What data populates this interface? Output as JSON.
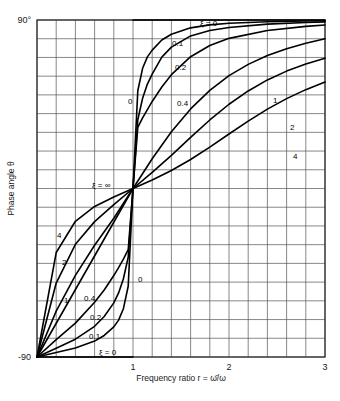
{
  "chart_data": {
    "type": "line",
    "title": "",
    "subtitle": "",
    "xlabel": "Frequency ratio r = ω̄/ω",
    "ylabel": "Phase angle θ",
    "xlim": [
      0,
      3
    ],
    "ylim": [
      -90,
      90
    ],
    "grid": true,
    "x_ticks": [
      "1",
      "2",
      "3"
    ],
    "x_tick_values": [
      1,
      2,
      3
    ],
    "y_ticks": [
      "90°",
      "-90"
    ],
    "y_tick_values": [
      90,
      -90
    ],
    "y_tick_top": "90°",
    "y_tick_bottom": "-90",
    "legend_position": "inline-annotations",
    "grid_x_step": 0.2,
    "grid_y_step": 10,
    "series": [
      {
        "name": "ξ = 0",
        "zeta": 0,
        "x": [
          0,
          0.2,
          0.4,
          0.6,
          0.8,
          0.9,
          0.98,
          1.0,
          1.02,
          1.1,
          1.2,
          1.4,
          1.6,
          1.8,
          2.0,
          2.2,
          2.4,
          2.6,
          2.8,
          3.0
        ],
        "y": [
          -90,
          -90,
          -90,
          -90,
          -90,
          -90,
          -90,
          0,
          90,
          90,
          90,
          90,
          90,
          90,
          90,
          90,
          90,
          90,
          90,
          90
        ]
      },
      {
        "name": "0.1",
        "zeta": 0.1,
        "x": [
          0,
          0.2,
          0.4,
          0.6,
          0.7,
          0.8,
          0.85,
          0.9,
          0.95,
          1.0,
          1.05,
          1.1,
          1.15,
          1.2,
          1.3,
          1.4,
          1.6,
          1.8,
          2.0,
          2.4,
          2.8,
          3.0
        ],
        "y": [
          -90,
          -87.6,
          -85.2,
          -81.5,
          -78.5,
          -73.9,
          -70.3,
          -64.2,
          -52.2,
          0,
          52.2,
          64.2,
          70.3,
          73.9,
          79.3,
          82.4,
          85.8,
          87.4,
          88.3,
          89.1,
          89.5,
          89.6
        ]
      },
      {
        "name": "0.2",
        "zeta": 0.2,
        "x": [
          0,
          0.2,
          0.4,
          0.6,
          0.7,
          0.8,
          0.85,
          0.9,
          0.95,
          1.0,
          1.05,
          1.1,
          1.15,
          1.2,
          1.3,
          1.4,
          1.6,
          1.8,
          2.0,
          2.4,
          2.8,
          3.0
        ],
        "y": [
          -90,
          -85.3,
          -80.5,
          -73.6,
          -68.4,
          -61.1,
          -55.8,
          -48.2,
          -36.7,
          0,
          36.7,
          48.2,
          55.8,
          61.1,
          70.2,
          75.5,
          81.5,
          84.4,
          86.0,
          87.8,
          88.7,
          89.0
        ]
      },
      {
        "name": "0.4",
        "zeta": 0.4,
        "x": [
          0,
          0.2,
          0.4,
          0.6,
          0.7,
          0.8,
          0.85,
          0.9,
          0.95,
          1.0,
          1.05,
          1.1,
          1.2,
          1.3,
          1.4,
          1.6,
          1.8,
          2.0,
          2.4,
          2.8,
          3.0
        ],
        "y": [
          -90,
          -80.7,
          -71.9,
          -60.8,
          -54.2,
          -46.5,
          -42.3,
          -37.7,
          -32.7,
          0,
          32.7,
          37.7,
          46.5,
          54.2,
          60.8,
          70.4,
          76.4,
          80.2,
          84.4,
          86.6,
          87.3
        ]
      },
      {
        "name": "1",
        "zeta": 1.0,
        "x": [
          0,
          0.2,
          0.4,
          0.6,
          0.8,
          1.0,
          1.2,
          1.4,
          1.6,
          1.8,
          2.0,
          2.2,
          2.4,
          2.6,
          2.8,
          3.0
        ],
        "y": [
          -90,
          -65.5,
          -46.4,
          -30.3,
          -15.9,
          0,
          15.9,
          30.3,
          42.5,
          52.4,
          60.3,
          66.3,
          71.0,
          74.7,
          77.6,
          80.0
        ]
      },
      {
        "name": "2",
        "zeta": 2.0,
        "x": [
          0,
          0.2,
          0.4,
          0.6,
          0.8,
          1.0,
          1.2,
          1.4,
          1.6,
          1.8,
          2.0,
          2.2,
          2.4,
          2.6,
          2.8,
          3.0
        ],
        "y": [
          -90,
          -50.5,
          -29.8,
          -17.7,
          -8.6,
          0,
          8.6,
          17.7,
          27.3,
          36.6,
          45.0,
          52.1,
          58.0,
          62.7,
          66.5,
          69.6
        ]
      },
      {
        "name": "4",
        "zeta": 4.0,
        "x": [
          0,
          0.2,
          0.4,
          0.6,
          0.8,
          1.0,
          1.2,
          1.4,
          1.6,
          1.8,
          2.0,
          2.2,
          2.4,
          2.6,
          2.8,
          3.0
        ],
        "y": [
          -90,
          -34.2,
          -17.5,
          -9.6,
          -4.5,
          0,
          4.5,
          9.6,
          15.5,
          22.1,
          29.1,
          36.0,
          42.4,
          48.0,
          52.8,
          56.9
        ]
      },
      {
        "name": "ξ = ∞",
        "zeta": "infinity",
        "x": [
          0,
          1.0
        ],
        "y": [
          -90,
          0
        ]
      }
    ],
    "annotations": [
      {
        "text": "ξ = 0",
        "x_px": 200,
        "y_px": 26,
        "name": "curve-label-zeta-0-top"
      },
      {
        "text": "0.1",
        "x_px": 172,
        "y_px": 46,
        "name": "curve-label-0p1-top"
      },
      {
        "text": "0.2",
        "x_px": 175,
        "y_px": 70,
        "name": "curve-label-0p2-top"
      },
      {
        "text": "0.4",
        "x_px": 177,
        "y_px": 106,
        "name": "curve-label-0p4-top"
      },
      {
        "text": "0",
        "x_px": 128,
        "y_px": 104,
        "name": "curve-label-0-upper"
      },
      {
        "text": "1",
        "x_px": 273,
        "y_px": 103,
        "name": "curve-label-1-right"
      },
      {
        "text": "2",
        "x_px": 290,
        "y_px": 130,
        "name": "curve-label-2-right"
      },
      {
        "text": "4",
        "x_px": 293,
        "y_px": 159,
        "name": "curve-label-4-right"
      },
      {
        "text": "ξ = ∞",
        "x_px": 92,
        "y_px": 188,
        "name": "curve-label-zeta-infinity"
      },
      {
        "text": "4",
        "x_px": 57,
        "y_px": 238,
        "name": "curve-label-4-left"
      },
      {
        "text": "2",
        "x_px": 62,
        "y_px": 265,
        "name": "curve-label-2-left"
      },
      {
        "text": "1",
        "x_px": 64,
        "y_px": 303,
        "name": "curve-label-1-left"
      },
      {
        "text": "0.4",
        "x_px": 84,
        "y_px": 301,
        "name": "curve-label-0p4-left"
      },
      {
        "text": "0.2",
        "x_px": 90,
        "y_px": 320,
        "name": "curve-label-0p2-left"
      },
      {
        "text": "0.1",
        "x_px": 89,
        "y_px": 339,
        "name": "curve-label-0p1-left"
      },
      {
        "text": "0",
        "x_px": 138,
        "y_px": 282,
        "name": "curve-label-0-lower"
      },
      {
        "text": "ξ = 0",
        "x_px": 99,
        "y_px": 355,
        "name": "curve-label-zeta-0-bottom"
      }
    ],
    "colors": {
      "curve": "#000000",
      "grid": "#555555",
      "frame": "#333333",
      "text": "#1a1a1a",
      "background": "#ffffff"
    }
  }
}
